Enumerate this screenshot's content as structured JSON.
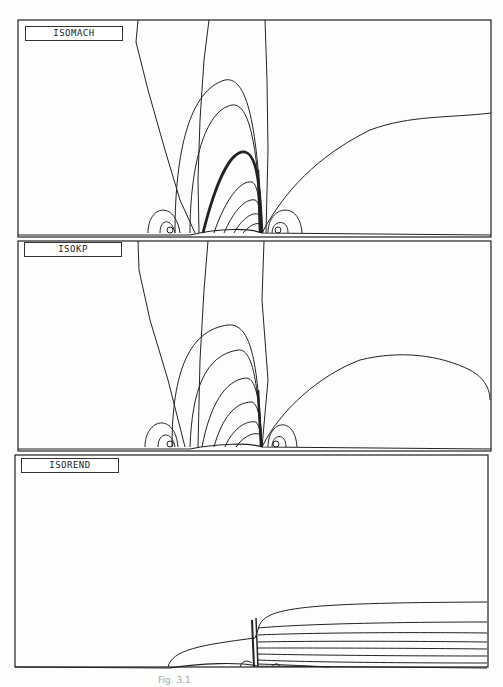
{
  "panels": [
    {
      "id": "isomach",
      "label": "ISOMACH"
    },
    {
      "id": "isokp",
      "label": "ISOKP"
    },
    {
      "id": "isorend",
      "label": "ISOREND"
    }
  ],
  "caption": "Fig. 3.1"
}
